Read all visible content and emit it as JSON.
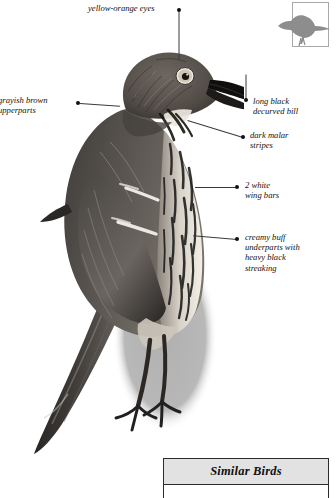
{
  "page": {
    "species_heading_fragment": "IER",
    "body_text_lines": [
      "thern",
      "in",
      "er,"
    ]
  },
  "range_map": {
    "name": "range-map-thumbnail",
    "bird_silhouette_color": "#8d8d8d",
    "frame_color": "#a9a9a9"
  },
  "illustration": {
    "name": "thrasher-illustration",
    "shadow_color": "#b8b8b8"
  },
  "callouts": [
    {
      "id": "eyes",
      "text": "yellow-orange eyes",
      "side": "top",
      "label_left": 88,
      "label_top": 4,
      "label_width": 96,
      "dot_left": 177,
      "dot_top": 8,
      "leader_length": 54,
      "leader_angle": 90
    },
    {
      "id": "upperparts",
      "text_line_1": "grayish brown",
      "text_line_2": "upperparts",
      "side": "left",
      "label_left": -2,
      "label_top": 96,
      "label_width": 74,
      "dot_left": 77,
      "dot_top": 101,
      "leader_length": 38,
      "leader_angle": 6
    },
    {
      "id": "bill",
      "text_line_1": "long black",
      "text_line_2": "decurved bill",
      "side": "right",
      "label_left": 254,
      "label_top": 100,
      "label_width": 80,
      "dot_left": 244,
      "dot_top": 102,
      "leader_length": 26,
      "leader_angle": -90
    },
    {
      "id": "malar",
      "text_line_1": "dark malar",
      "text_line_2": "stripes",
      "side": "right",
      "label_left": 251,
      "label_top": 133,
      "label_width": 80,
      "dot_left": 241,
      "dot_top": 136,
      "leader_length": 52,
      "leader_angle": 196
    },
    {
      "id": "wingbars",
      "text_line_1": "2 white",
      "text_line_2": "wing bars",
      "side": "right",
      "label_left": 246,
      "label_top": 183,
      "label_width": 80,
      "dot_left": 236,
      "dot_top": 185,
      "leader_length": 40,
      "leader_angle": 181
    },
    {
      "id": "underparts",
      "text_line_1": "creamy buff",
      "text_line_2": "underparts with",
      "text_line_3": "heavy black",
      "text_line_4": "streaking",
      "side": "right",
      "label_left": 246,
      "label_top": 235,
      "label_width": 86,
      "dot_left": 236,
      "dot_top": 237,
      "leader_length": 42,
      "leader_angle": 186
    }
  ],
  "similar_birds": {
    "title": "Similar Birds"
  }
}
